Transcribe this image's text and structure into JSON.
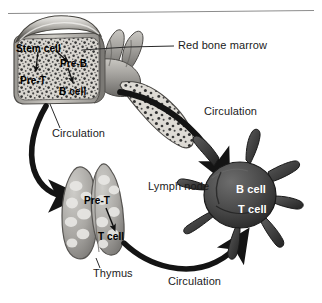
{
  "figure": {
    "background_color": "#ffffff",
    "rule_color": "#8c8c8c",
    "ink_color": "#1b1b1b",
    "marrow_fill": "#d8d5cf",
    "marrow_stipple": "#3a3a3a",
    "bone_fill": "#b8b6b1",
    "bone_shade": "#6f6d69",
    "thymus_fill": "#a9a7a3",
    "thymus_lobule": "#e4e3e0",
    "lymph_node_fill": "#4a4a4a",
    "lymph_node_shade": "#2e2e2e",
    "arrow_color": "#141414"
  },
  "labels": {
    "stem_cell": "Stem cell",
    "pre_b": "Pre-B",
    "pre_t_marrow": "Pre-T",
    "b_cell_marrow": "B cell",
    "red_bone_marrow": "Red bone marrow",
    "circulation_left": "Circulation",
    "circulation_right": "Circulation",
    "circulation_bottom": "Circulation",
    "pre_t_thymus": "Pre-T",
    "t_cell_thymus": "T cell",
    "thymus": "Thymus",
    "lymph_node": "Lymph node",
    "b_cell_node": "B cell",
    "t_cell_node": "T cell"
  },
  "structures": [
    {
      "name": "red-bone-marrow",
      "label": "Red bone marrow",
      "cells": [
        "Stem cell",
        "Pre-B",
        "Pre-T",
        "B cell"
      ]
    },
    {
      "name": "thymus",
      "label": "Thymus",
      "cells": [
        "Pre-T",
        "T cell"
      ]
    },
    {
      "name": "lymph-node",
      "label": "Lymph node",
      "cells": [
        "B cell",
        "T cell"
      ]
    }
  ],
  "pathways": [
    {
      "name": "marrow-to-thymus",
      "label": "Circulation"
    },
    {
      "name": "marrow-to-lymph-node",
      "label": "Circulation"
    },
    {
      "name": "thymus-to-lymph-node",
      "label": "Circulation"
    }
  ]
}
